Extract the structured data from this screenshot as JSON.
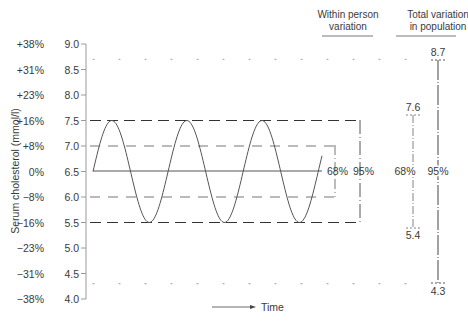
{
  "chart_data": {
    "type": "line",
    "title": "",
    "xlabel": "Time",
    "ylabel": "Serum cholesterol (mmol/l)",
    "ylim": [
      4.0,
      9.0
    ],
    "grid": false,
    "y_ticks": [
      9.0,
      8.5,
      8.0,
      7.5,
      7.0,
      6.5,
      6.0,
      5.5,
      5.0,
      4.5,
      4.0
    ],
    "y_tick_labels": [
      "9.0",
      "8.5",
      "8.0",
      "7.5",
      "7.0",
      "6.5",
      "6.0",
      "5.5",
      "5.0",
      "4.5",
      "4.0"
    ],
    "y_pct_labels": [
      "+38%",
      "+31%",
      "+23%",
      "+16%",
      "+8%",
      "0%",
      "−8%",
      "−16%",
      "−23%",
      "−31%",
      "−38%"
    ],
    "series": [
      {
        "name": "Within person cholesterol over time",
        "form": "sine",
        "mean": 6.5,
        "amplitude": 1.0,
        "cycles": 3,
        "start_value": 6.5
      }
    ],
    "reference_lines": [
      {
        "name": "mean",
        "value": 6.5,
        "style": "solid"
      },
      {
        "name": "68% upper",
        "value": 7.0,
        "style": "dashed"
      },
      {
        "name": "68% lower",
        "value": 6.0,
        "style": "dashed"
      },
      {
        "name": "95% upper",
        "value": 7.5,
        "style": "dashed"
      },
      {
        "name": "95% lower",
        "value": 5.5,
        "style": "dashed"
      },
      {
        "name": "population upper dotted",
        "value": 8.7,
        "style": "dotted"
      },
      {
        "name": "population lower dotted",
        "value": 4.3,
        "style": "dotted"
      }
    ],
    "within_person": {
      "header": [
        "Within person",
        "variation"
      ],
      "range_68": {
        "low": 6.0,
        "high": 7.0,
        "label": "68%"
      },
      "range_95": {
        "low": 5.5,
        "high": 7.5,
        "label": "95%"
      }
    },
    "population": {
      "header": [
        "Total variation",
        "in population"
      ],
      "range_68": {
        "low": 5.4,
        "high": 7.6,
        "label": "68%",
        "low_label": "5.4",
        "high_label": "7.6"
      },
      "range_95": {
        "low": 4.3,
        "high": 8.7,
        "label": "95%",
        "low_label": "4.3",
        "high_label": "8.7"
      }
    }
  },
  "labels": {
    "ylabel": "Serum cholesterol (mmol/l)",
    "time": "Time",
    "within_header_1": "Within person",
    "within_header_2": "variation",
    "pop_header_1": "Total variation",
    "pop_header_2": "in population",
    "within_68": "68%",
    "within_95": "95%",
    "pop_68": "68%",
    "pop_95": "95%",
    "pop_87": "8.7",
    "pop_76": "7.6",
    "pop_54": "5.4",
    "pop_43": "4.3"
  },
  "colors": {
    "ink": "#3a3a3a",
    "axis": "#9a9a9a",
    "curve": "#555555",
    "dashed": "#444444",
    "dotted": "#aaaaaa"
  }
}
